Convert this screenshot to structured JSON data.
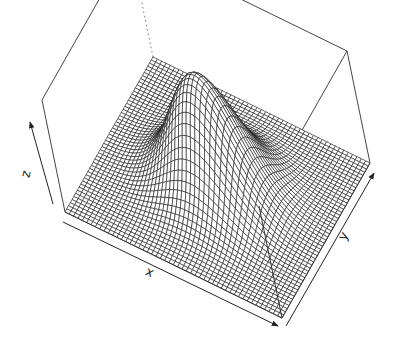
{
  "chart_data": {
    "type": "surface3d",
    "title": "",
    "xlabel": "x",
    "ylabel": "y",
    "zlabel": "z",
    "function": "z = exp(-(x^2 + y^2)) (bivariate Gaussian bump)",
    "x_range": [
      -3,
      3
    ],
    "y_range": [
      -3,
      3
    ],
    "z_range": [
      0,
      1
    ],
    "grid_lines": 50,
    "peak": {
      "x": 0,
      "y": 0,
      "z": 1
    },
    "style": {
      "line_color": "#1a1a1a",
      "fill_color": "#ffffff",
      "box": true,
      "ticks": false
    },
    "view": {
      "theta_deg": 30,
      "phi_deg": 30
    }
  },
  "projection": {
    "base_front_left": [
      65,
      212
    ],
    "base_front_right": [
      282,
      318
    ],
    "base_back_right": [
      370,
      163
    ],
    "top_front_left": [
      42,
      100
    ],
    "top_back_left": [
      193,
      30
    ],
    "top_back_right": [
      383,
      75
    ],
    "top_front_right": [
      374,
      76
    ]
  },
  "labels": {
    "x": {
      "text": "x",
      "pos": [
        148,
        276
      ],
      "rotate": 25
    },
    "y": {
      "text": "y",
      "pos": [
        347,
        238
      ],
      "rotate": -62
    },
    "z": {
      "text": "z",
      "pos": [
        30,
        175
      ],
      "rotate": -78
    }
  }
}
